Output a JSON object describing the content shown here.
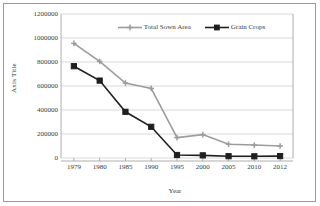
{
  "chart_data": {
    "type": "line",
    "title": "",
    "xlabel": "Year",
    "ylabel": "Axis Title",
    "categories": [
      "1979",
      "1980",
      "1985",
      "1990",
      "1995",
      "2000",
      "2005",
      "2010",
      "2012"
    ],
    "ylim": [
      0,
      1200000
    ],
    "yticks": [
      0,
      200000,
      400000,
      600000,
      800000,
      1000000,
      1200000
    ],
    "ytick_labels": [
      "0",
      "200000",
      "400000",
      "600000",
      "800000",
      "1000000",
      "1200000"
    ],
    "grid": true,
    "legend_position": "top-center",
    "series": [
      {
        "name": "Total Sown Area",
        "color": "#9c9c9c",
        "marker": "cross",
        "values": [
          955000,
          805000,
          625000,
          580000,
          170000,
          195000,
          115000,
          108000,
          100000
        ]
      },
      {
        "name": "Grain Crops",
        "color": "#1f1f1f",
        "marker": "square",
        "values": [
          765000,
          645000,
          385000,
          260000,
          25000,
          22000,
          15000,
          14000,
          16000
        ]
      }
    ]
  },
  "colors": {
    "grid": "#c9c9c9",
    "axis": "#9a9a9a",
    "border": "#9a9a9a",
    "text": "#3a3a3a"
  }
}
